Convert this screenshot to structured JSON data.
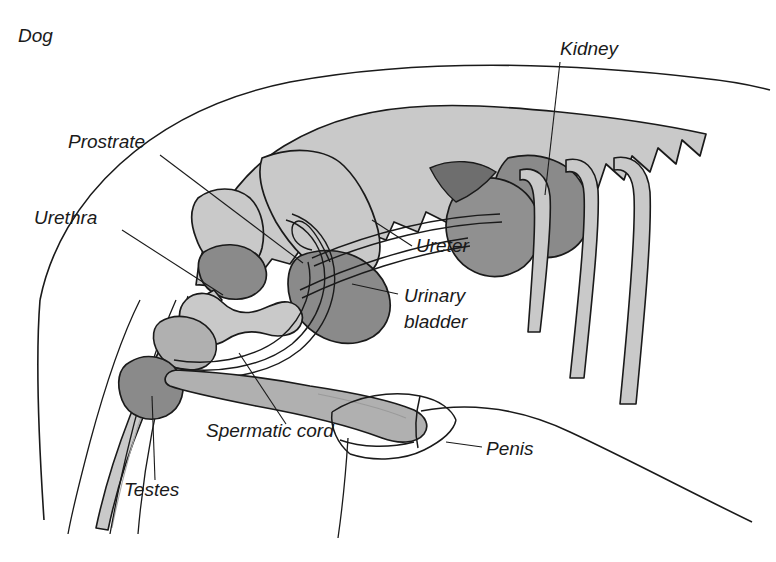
{
  "figure": {
    "title": "Dog",
    "background_color": "#ffffff",
    "outline_color": "#1a1a1a",
    "fill_light": "#c9c9c9",
    "fill_mid": "#b0b0b0",
    "fill_dark": "#8a8a8a",
    "label_color": "#1a1a1a"
  },
  "labels": [
    {
      "id": "prostrate",
      "text": "Prostrate",
      "x": 68,
      "y": 148,
      "anchor": "start",
      "leader": "M 160 155 L 303 263"
    },
    {
      "id": "urethra",
      "text": "Urethra",
      "x": 34,
      "y": 224,
      "anchor": "start",
      "leader": "M 122 230 L 223 295"
    },
    {
      "id": "kidney",
      "text": "Kidney",
      "x": 560,
      "y": 55,
      "anchor": "start",
      "leader": "M 560 62 L 545 195"
    },
    {
      "id": "ureter",
      "text": "Ureter",
      "x": 416,
      "y": 252,
      "anchor": "start",
      "leader": "M 412 246 L 372 220"
    },
    {
      "id": "urinary-bladder",
      "text": "Urinary",
      "text2": "bladder",
      "x": 404,
      "y": 302,
      "y2": 328,
      "anchor": "start",
      "leader": "M 398 294 L 352 284"
    },
    {
      "id": "spermatic-cord",
      "text": "Spermatic cord",
      "x": 206,
      "y": 437,
      "anchor": "start",
      "leader": "M 286 424 L 239 353"
    },
    {
      "id": "testes",
      "text": "Testes",
      "x": 124,
      "y": 496,
      "anchor": "start",
      "leader": "M 155 480 L 152 396"
    },
    {
      "id": "penis",
      "text": "Penis",
      "x": 486,
      "y": 455,
      "anchor": "start",
      "leader": "M 482 447 L 446 442"
    }
  ],
  "organs": [
    {
      "id": "vertebral-column",
      "name": "vertebral column with spinous processes",
      "tone": "light"
    },
    {
      "id": "pelvis",
      "name": "pelvic bone",
      "tone": "light"
    },
    {
      "id": "kidney-left",
      "name": "left kidney",
      "tone": "dark"
    },
    {
      "id": "kidney-right",
      "name": "right kidney",
      "tone": "dark"
    },
    {
      "id": "ureter-tubes",
      "name": "ureters",
      "tone": "outline"
    },
    {
      "id": "urinary-bladder-organ",
      "name": "urinary bladder",
      "tone": "dark"
    },
    {
      "id": "prostate-gland",
      "name": "prostate gland",
      "tone": "dark"
    },
    {
      "id": "urethra-tube",
      "name": "urethra",
      "tone": "mid"
    },
    {
      "id": "testis-organ",
      "name": "testis",
      "tone": "dark"
    },
    {
      "id": "spermatic-cord-loop",
      "name": "spermatic cord",
      "tone": "outline"
    },
    {
      "id": "penis-organ",
      "name": "penis",
      "tone": "mid"
    },
    {
      "id": "hind-limb-bones",
      "name": "hind limb bones",
      "tone": "light"
    },
    {
      "id": "body-outline",
      "name": "body contour",
      "tone": "outline"
    }
  ]
}
